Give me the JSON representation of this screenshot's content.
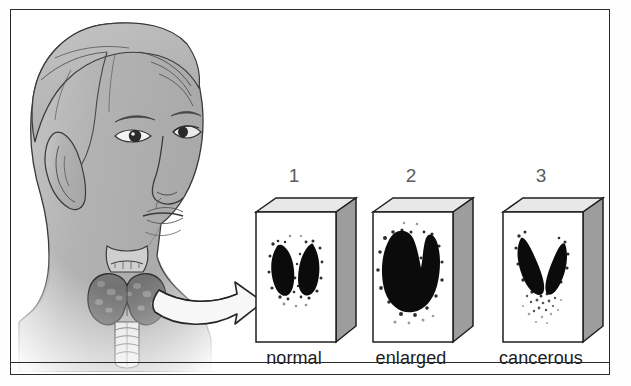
{
  "figure": {
    "border_color": "#2a2a2a",
    "background_color": "#ffffff"
  },
  "anatomy": {
    "name": "head-neck-profile-illustration",
    "description": "Grayscale drawing of a human head and neck in three-quarter profile with thyroid gland exposed at the base of the neck",
    "skin_tone": "#b4b4b4",
    "outline_color": "#3a3a3a",
    "thyroid": {
      "name": "thyroid-gland",
      "fill": "#6e6e6e",
      "larynx_label": "larynx",
      "trachea_label": "trachea"
    },
    "arrow": {
      "name": "pointer-arrow",
      "fill": "#f2f2f2",
      "stroke": "#2a2a2a"
    }
  },
  "scans": [
    {
      "number": "1",
      "label": "normal",
      "pattern": "two-lobes-separated",
      "front_fill": "#ffffff",
      "top_fill": "#e6e6e6",
      "side_fill": "#9a9a9a",
      "uptake_color": "#0a0a0a"
    },
    {
      "number": "2",
      "label": "enlarged",
      "pattern": "large-connected-u-shape",
      "front_fill": "#ffffff",
      "top_fill": "#e6e6e6",
      "side_fill": "#9a9a9a",
      "uptake_color": "#0a0a0a"
    },
    {
      "number": "3",
      "label": "cancerous",
      "pattern": "two-lobes-with-scattered-speckle",
      "front_fill": "#ffffff",
      "top_fill": "#e6e6e6",
      "side_fill": "#9a9a9a",
      "uptake_color": "#0a0a0a"
    }
  ]
}
